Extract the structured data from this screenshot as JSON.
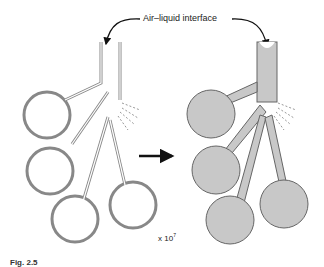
{
  "diagram": {
    "title_label": "Air–liquid interface",
    "scale": {
      "base": "x 10",
      "exponent": "7"
    },
    "figure_label": "Fig. 2.5",
    "panels": [
      {
        "name": "air-filled-lung",
        "fill": "#ffffff",
        "stroke": "#777777"
      },
      {
        "name": "liquid-filled-lung",
        "fill": "#c8c8c8",
        "stroke": "#666666"
      }
    ],
    "arrow_color": "#111111"
  }
}
